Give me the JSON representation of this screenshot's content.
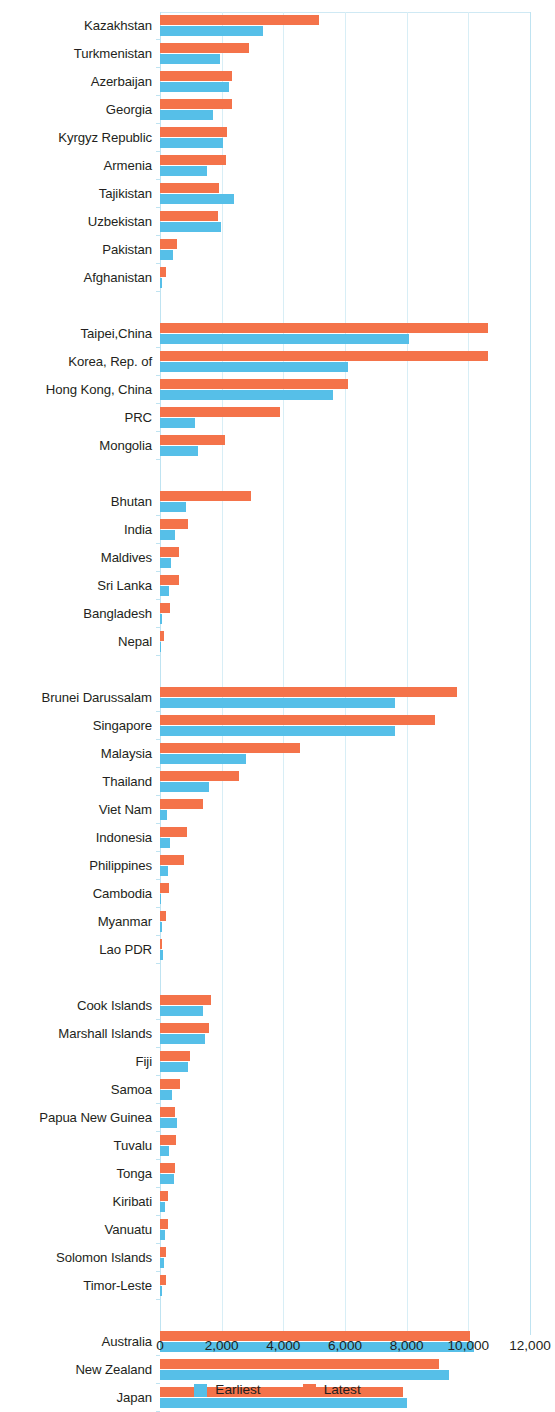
{
  "chart_data": {
    "type": "bar",
    "orientation": "horizontal",
    "title": "",
    "subtitle": "",
    "xlabel": "",
    "ylabel": "",
    "xlim": [
      0,
      12000
    ],
    "grid": true,
    "grid_axis": "x",
    "legend_position": "bottom-center",
    "xticks": [
      "0",
      "2,000",
      "4,000",
      "6,000",
      "8,000",
      "10,000",
      "12,000"
    ],
    "xtick_values": [
      0,
      2000,
      4000,
      6000,
      8000,
      10000,
      12000
    ],
    "series": [
      {
        "name": "Earliest",
        "color": "#56bfe8"
      },
      {
        "name": "Latest",
        "color": "#f4734a"
      }
    ],
    "groups": [
      {
        "name": "Central and West Asia",
        "categories": [
          "Kazakhstan",
          "Turkmenistan",
          "Azerbaijan",
          "Georgia",
          "Kyrgyz Republic",
          "Armenia",
          "Tajikistan",
          "Uzbekistan",
          "Pakistan",
          "Afghanistan"
        ],
        "earliest": [
          3350,
          1950,
          2230,
          1720,
          2050,
          1530,
          2400,
          1990,
          410,
          60
        ],
        "latest": [
          5150,
          2900,
          2330,
          2330,
          2170,
          2150,
          1900,
          1870,
          560,
          190
        ]
      },
      {
        "name": "East Asia",
        "categories": [
          "Taipei,China",
          "Korea, Rep. of",
          "Hong Kong, China",
          "PRC",
          "Mongolia"
        ],
        "earliest": [
          8070,
          6100,
          5620,
          1120,
          1230
        ],
        "latest": [
          10640,
          10640,
          6110,
          3900,
          2120
        ]
      },
      {
        "name": "South Asia",
        "categories": [
          "Bhutan",
          "India",
          "Maldives",
          "Sri Lanka",
          "Bangladesh",
          "Nepal"
        ],
        "earliest": [
          840,
          490,
          360,
          290,
          80,
          40
        ],
        "latest": [
          2940,
          900,
          620,
          620,
          320,
          140
        ]
      },
      {
        "name": "Southeast Asia",
        "categories": [
          "Brunei Darussalam",
          "Singapore",
          "Malaysia",
          "Thailand",
          "Viet Nam",
          "Indonesia",
          "Philippines",
          "Cambodia",
          "Myanmar",
          "Lao PDR"
        ],
        "earliest": [
          7620,
          7620,
          2790,
          1590,
          230,
          330,
          260,
          40,
          50,
          110
        ],
        "latest": [
          9630,
          8930,
          4550,
          2560,
          1400,
          870,
          770,
          300,
          180,
          60
        ]
      },
      {
        "name": "The Pacific",
        "categories": [
          "Cook Islands",
          "Marshall Islands",
          "Fiji",
          "Samoa",
          "Papua New Guinea",
          "Tuvalu",
          "Tonga",
          "Kiribati",
          "Vanuatu",
          "Solomon Islands",
          "Timor-Leste"
        ],
        "earliest": [
          1400,
          1450,
          900,
          380,
          550,
          290,
          450,
          170,
          170,
          120,
          60
        ],
        "latest": [
          1640,
          1580,
          960,
          640,
          500,
          510,
          480,
          250,
          250,
          190,
          190
        ]
      },
      {
        "name": "Developed Member Economies",
        "categories": [
          "Australia",
          "New Zealand",
          "Japan"
        ],
        "earliest": [
          10180,
          9380,
          8020
        ],
        "latest": [
          10060,
          9050,
          7880
        ]
      }
    ]
  },
  "legend": {
    "items": [
      {
        "label": "Earliest",
        "color": "#56bfe8"
      },
      {
        "label": "Latest",
        "color": "#f4734a"
      }
    ]
  },
  "axis": {
    "x_ticks": [
      "0",
      "2,000",
      "4,000",
      "6,000",
      "8,000",
      "10,000",
      "12,000"
    ]
  },
  "colors": {
    "earliest": "#56bfe8",
    "latest": "#f4734a",
    "gridline": "#d8eef6",
    "text": "#231f20"
  }
}
